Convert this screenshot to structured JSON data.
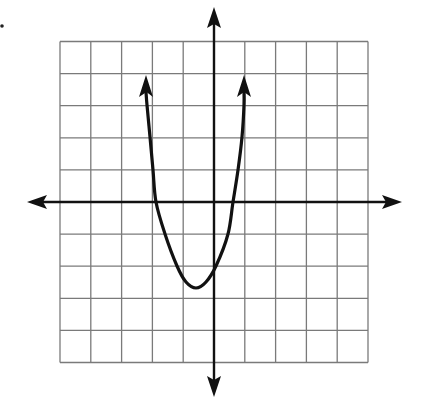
{
  "chart_data": {
    "type": "line",
    "title": "",
    "xlabel": "",
    "ylabel": "",
    "description": "Upward-opening parabola on a 10x10 coordinate grid with arrows at both ends of the curve and on both axes",
    "grid": true,
    "xlim": [
      -5,
      5
    ],
    "ylim": [
      -5,
      5
    ],
    "x_ticks": [
      -5,
      -4,
      -3,
      -2,
      -1,
      0,
      1,
      2,
      3,
      4,
      5
    ],
    "y_ticks": [
      -5,
      -4,
      -3,
      -2,
      -1,
      0,
      1,
      2,
      3,
      4,
      5
    ],
    "tick_labels_shown": false,
    "series": [
      {
        "name": "parabola",
        "shape": "parabola-opening-up",
        "vertex": [
          -0.6,
          -2.7
        ],
        "x_intercepts": [
          -1.9,
          0.6
        ],
        "end_arrows": [
          [
            -2.2,
            4.0
          ],
          [
            1.0,
            4.0
          ]
        ],
        "x": [
          -2.2,
          -2.15,
          -2.05,
          -1.98,
          -1.88,
          -1.6,
          -1.2,
          -0.6,
          -0.1,
          0.2,
          0.45,
          0.62,
          0.77,
          0.9,
          0.97,
          1.0
        ],
        "y": [
          4.0,
          3.0,
          2.0,
          1.0,
          0.0,
          -1.0,
          -2.0,
          -2.7,
          -2.2,
          -1.0,
          -1.0,
          0.0,
          1.0,
          2.0,
          3.0,
          4.0
        ]
      }
    ],
    "colors": {
      "grid": "#7a7a7a",
      "axis": "#111111",
      "curve": "#111111",
      "background": "#ffffff"
    }
  },
  "labels": {
    "x_axis": "x-axis",
    "y_axis": "y-axis"
  }
}
